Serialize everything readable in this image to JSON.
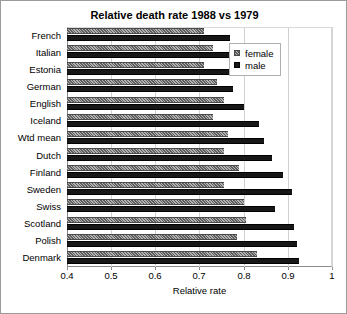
{
  "chart_data": {
    "type": "bar",
    "orientation": "horizontal",
    "title": "Relative death rate 1988 vs 1979",
    "xlabel": "Relative rate",
    "ylabel": "",
    "xlim": [
      0.4,
      1.0
    ],
    "xticks": [
      "0.4",
      "0.5",
      "0.6",
      "0.7",
      "0.8",
      "0.9",
      "1"
    ],
    "xtick_values": [
      0.4,
      0.5,
      0.6,
      0.7,
      0.8,
      0.9,
      1.0
    ],
    "grid": "vertical",
    "legend_position": "top-right",
    "categories": [
      "French",
      "Italian",
      "Estonia",
      "German",
      "English",
      "Iceland",
      "Wtd mean",
      "Dutch",
      "Finland",
      "Sweden",
      "Swiss",
      "Scotland",
      "Polish",
      "Denmark"
    ],
    "series": [
      {
        "name": "female",
        "color": "#8f8f8f",
        "values": [
          0.71,
          0.73,
          0.71,
          0.74,
          0.755,
          0.73,
          0.765,
          0.755,
          0.79,
          0.755,
          0.8,
          0.805,
          0.785,
          0.83
        ]
      },
      {
        "name": "male",
        "color": "#171717",
        "values": [
          0.77,
          0.805,
          0.775,
          0.775,
          0.8,
          0.835,
          0.845,
          0.865,
          0.89,
          0.91,
          0.87,
          0.915,
          0.92,
          0.925
        ]
      }
    ]
  },
  "legend": {
    "items": [
      {
        "label": "female",
        "swatch": "female-swatch-icon"
      },
      {
        "label": "male",
        "swatch": "male-swatch-icon"
      }
    ]
  }
}
